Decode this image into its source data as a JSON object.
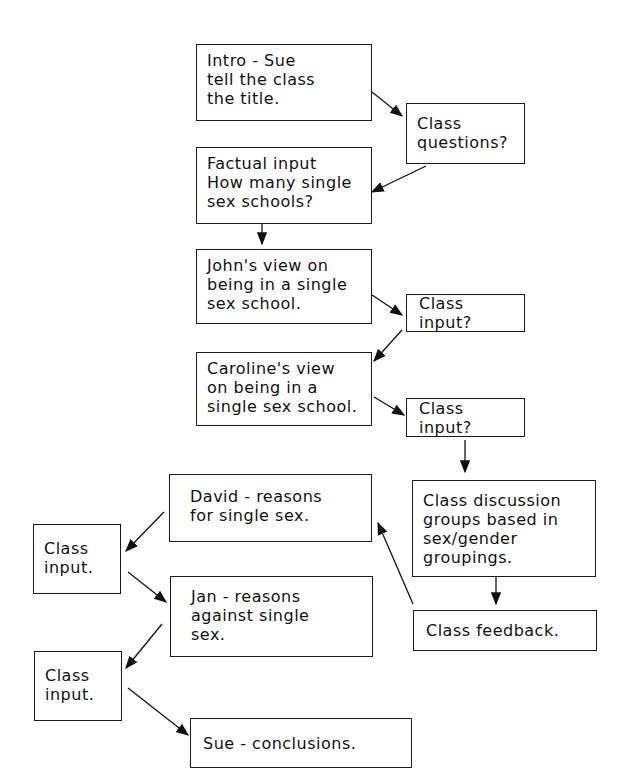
{
  "flowchart": {
    "nodes": {
      "intro": [
        "Intro - Sue",
        "tell the class",
        "the title."
      ],
      "class_questions": [
        "Class",
        "questions?"
      ],
      "factual": [
        "Factual input",
        "How many single",
        "sex schools?"
      ],
      "john": [
        "John's view on",
        "being in a single",
        "sex school."
      ],
      "class_input_1": "Class input?",
      "caroline": [
        "Caroline's view",
        "on being in a",
        "single sex school."
      ],
      "class_input_2": "Class input?",
      "discussion": [
        "Class discussion",
        "groups based in",
        "sex/gender",
        "groupings."
      ],
      "feedback": "Class feedback.",
      "david": [
        "David - reasons",
        "for single sex."
      ],
      "class_input_3": [
        "Class",
        "input."
      ],
      "jan": [
        "Jan - reasons",
        "against single",
        "sex."
      ],
      "class_input_4": [
        "Class",
        "input."
      ],
      "conclusions": "Sue - conclusions."
    }
  }
}
